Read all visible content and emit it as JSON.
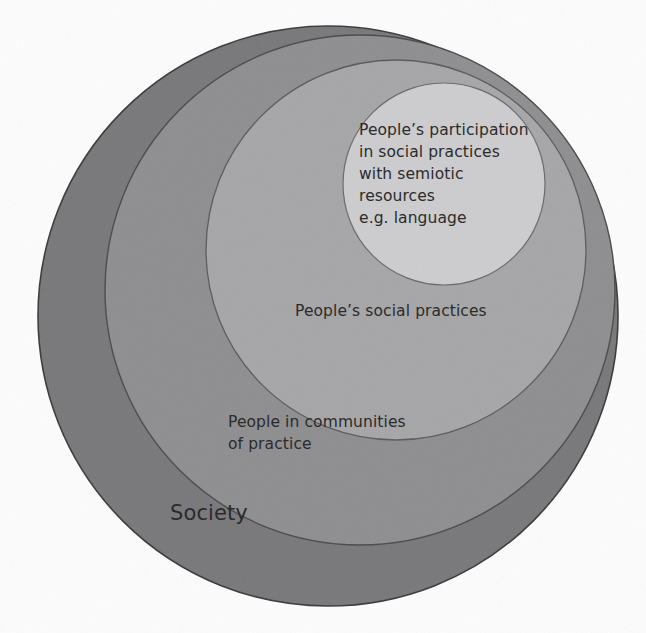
{
  "diagram": {
    "type": "nested-circles",
    "title": "",
    "background_color": "#fdfdfd",
    "outline_color": "#3a3a3a",
    "text_color": "#2b2b2b",
    "rings": [
      {
        "id": "society",
        "label": "Society",
        "fill": "#78787a",
        "cx": 328,
        "cy": 316,
        "r": 290,
        "level": 1
      },
      {
        "id": "communities-of-practice",
        "label": "People in communities\nof practice",
        "fill": "#8e8e90",
        "cx": 360,
        "cy": 290,
        "r": 255,
        "level": 2
      },
      {
        "id": "social-practices",
        "label": "People’s social practices",
        "fill": "#a6a6a8",
        "cx": 396,
        "cy": 250,
        "r": 190,
        "level": 3
      },
      {
        "id": "participation",
        "label": "People’s participation\nin social practices\nwith semiotic\nresources\ne.g. language",
        "fill": "#cdcdcf",
        "cx": 444,
        "cy": 184,
        "r": 101,
        "level": 4
      }
    ]
  },
  "labels": {
    "innermost": "People’s participation\nin social practices\nwith semiotic\nresources\ne.g. language",
    "social_practices": "People’s social practices",
    "communities": "People in communities\nof practice",
    "society": "Society"
  }
}
